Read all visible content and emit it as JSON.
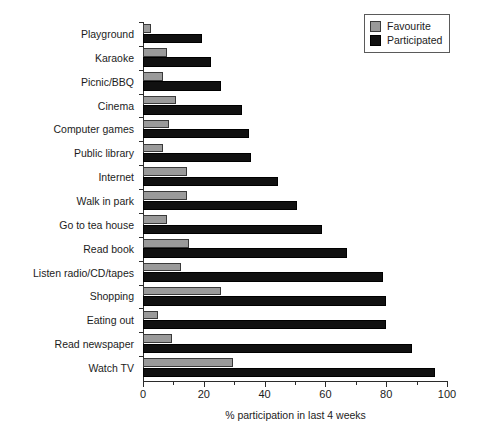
{
  "chart_data": {
    "type": "bar",
    "orientation": "horizontal",
    "title": "",
    "xlabel": "% participation in last 4 weeks",
    "ylabel": "",
    "xlim": [
      0,
      100
    ],
    "xticks": [
      0,
      20,
      40,
      60,
      80,
      100
    ],
    "xminorticks": [
      10,
      30,
      50,
      70,
      90
    ],
    "grid": false,
    "legend_position": "top-right",
    "categories": [
      "Playground",
      "Karaoke",
      "Picnic/BBQ",
      "Cinema",
      "Computer games",
      "Public library",
      "Internet",
      "Walk in park",
      "Go to tea house",
      "Read book",
      "Listen radio/CD/tapes",
      "Shopping",
      "Eating out",
      "Read newspaper",
      "Watch TV"
    ],
    "series": [
      {
        "name": "Favourite",
        "color": "#9a9a9a",
        "values": [
          2.5,
          8,
          6.5,
          11,
          8.5,
          6.5,
          14.5,
          14.5,
          8,
          15,
          12.5,
          25.5,
          5,
          9.5,
          29.5
        ]
      },
      {
        "name": "Participated",
        "color": "#111111",
        "values": [
          19.5,
          22.5,
          25.5,
          32.5,
          35,
          35.5,
          44.5,
          50.5,
          59,
          67,
          79,
          80,
          80,
          88.5,
          96
        ]
      }
    ]
  },
  "legend": {
    "items": [
      {
        "label": "Favourite",
        "swatch": "favourite-swatch"
      },
      {
        "label": "Participated",
        "swatch": "participated-swatch"
      }
    ]
  }
}
